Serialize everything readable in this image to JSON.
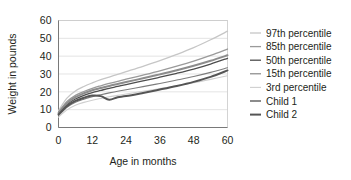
{
  "chart_data": {
    "type": "line",
    "title": "",
    "xlabel": "Age in months",
    "ylabel": "Weight in pounds",
    "xlim": [
      0,
      60
    ],
    "ylim": [
      0,
      60
    ],
    "xticks": [
      0,
      12,
      24,
      36,
      48,
      60
    ],
    "yticks": [
      0,
      10,
      20,
      30,
      40,
      50,
      60
    ],
    "grid": "horizontal",
    "legend_position": "right",
    "x": [
      0,
      3,
      6,
      9,
      12,
      15,
      18,
      21,
      24,
      30,
      36,
      42,
      48,
      54,
      60
    ],
    "series": [
      {
        "name": "97th percentile",
        "color": "#c6c6c6",
        "width": 1.3,
        "values": [
          9.5,
          16.5,
          20.5,
          23.0,
          25.0,
          26.8,
          28.3,
          29.8,
          31.3,
          34.3,
          37.5,
          41.0,
          44.8,
          49.2,
          54.0
        ]
      },
      {
        "name": "85th percentile",
        "color": "#9a9a9a",
        "width": 1.3,
        "values": [
          8.6,
          14.6,
          18.0,
          20.2,
          22.0,
          23.4,
          24.7,
          25.9,
          27.1,
          29.4,
          31.8,
          34.4,
          37.2,
          40.4,
          44.0
        ]
      },
      {
        "name": "50th percentile",
        "color": "#4d4d4d",
        "width": 1.3,
        "values": [
          7.6,
          12.9,
          16.0,
          18.0,
          19.6,
          20.8,
          22.0,
          23.0,
          24.1,
          26.1,
          28.2,
          30.4,
          32.8,
          35.6,
          38.8
        ]
      },
      {
        "name": "15th percentile",
        "color": "#7d7d7d",
        "width": 1.1,
        "values": [
          6.6,
          11.3,
          14.1,
          15.9,
          17.3,
          18.4,
          19.4,
          20.3,
          21.2,
          22.9,
          24.7,
          26.6,
          28.6,
          30.9,
          33.5
        ]
      },
      {
        "name": "3rd percentile",
        "color": "#cfcfcf",
        "width": 1.1,
        "values": [
          5.8,
          9.9,
          12.5,
          14.1,
          15.3,
          16.3,
          17.2,
          18.0,
          18.8,
          20.3,
          21.8,
          23.4,
          25.1,
          27.0,
          29.0
        ]
      },
      {
        "name": "Child 1",
        "color": "#8c8c8c",
        "width": 2.0,
        "values": [
          8.0,
          13.6,
          17.0,
          19.2,
          20.9,
          22.1,
          23.3,
          24.4,
          25.5,
          27.6,
          29.8,
          32.1,
          34.6,
          37.4,
          40.5
        ]
      },
      {
        "name": "Child 2",
        "color": "#555555",
        "width": 2.0,
        "values": [
          7.2,
          12.0,
          14.9,
          16.7,
          17.9,
          17.6,
          15.6,
          17.0,
          17.6,
          19.4,
          21.3,
          23.3,
          25.6,
          28.4,
          32.0
        ]
      }
    ]
  },
  "legend": {
    "items": [
      {
        "label": "97th percentile"
      },
      {
        "label": "85th percentile"
      },
      {
        "label": "50th percentile"
      },
      {
        "label": "15th percentile"
      },
      {
        "label": "3rd percentile"
      },
      {
        "label": "Child 1"
      },
      {
        "label": "Child 2"
      }
    ]
  }
}
